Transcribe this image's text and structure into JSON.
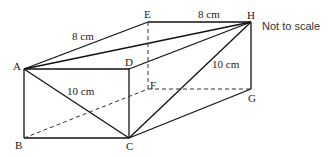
{
  "diagram": {
    "type": "cuboid",
    "note": "Not to scale",
    "vertices": {
      "A": {
        "label": "A",
        "x": 24,
        "y": 69
      },
      "B": {
        "label": "B",
        "x": 24,
        "y": 138
      },
      "C": {
        "label": "C",
        "x": 129,
        "y": 138
      },
      "D": {
        "label": "D",
        "x": 129,
        "y": 69
      },
      "E": {
        "label": "E",
        "x": 148,
        "y": 22
      },
      "F": {
        "label": "F",
        "x": 148,
        "y": 89
      },
      "G": {
        "label": "G",
        "x": 251,
        "y": 89
      },
      "H": {
        "label": "H",
        "x": 251,
        "y": 22
      }
    },
    "labels": {
      "A": "A",
      "B": "B",
      "C": "C",
      "D": "D",
      "E": "E",
      "F": "F",
      "G": "G",
      "H": "H"
    },
    "measurements": {
      "AE": "8 cm",
      "EH": "8 cm",
      "CH": "10 cm",
      "AC": "10 cm"
    }
  }
}
